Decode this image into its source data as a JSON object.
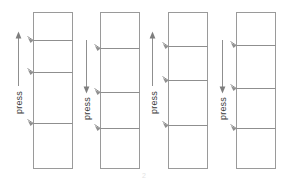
{
  "figure": {
    "background_color": "#ffffff",
    "line_color": "#9a9a9a",
    "label_color": "#3a3a3a",
    "width": 288,
    "height": 180,
    "caption": "2"
  },
  "columns": [
    {
      "id": "column-1",
      "index": 1,
      "x": 33,
      "y": 12,
      "width": 39,
      "height": 156,
      "dividers": [
        40,
        72,
        123
      ],
      "segments": 4,
      "press": {
        "label": "press",
        "direction": "up",
        "arrow_x": 18,
        "arrow_top": 33,
        "arrow_bottom": 86,
        "label_x": 22,
        "label_y": 114
      }
    },
    {
      "id": "column-2",
      "index": 2,
      "x": 100,
      "y": 12,
      "width": 39,
      "height": 156,
      "dividers": [
        48,
        92,
        128
      ],
      "segments": 4,
      "press": {
        "label": "press",
        "direction": "down",
        "arrow_x": 86,
        "arrow_top": 40,
        "arrow_bottom": 92,
        "label_x": 90,
        "label_y": 120
      }
    },
    {
      "id": "column-3",
      "index": 3,
      "x": 168,
      "y": 12,
      "width": 39,
      "height": 156,
      "dividers": [
        46,
        80,
        125
      ],
      "segments": 4,
      "press": {
        "label": "press",
        "direction": "up",
        "arrow_x": 152,
        "arrow_top": 33,
        "arrow_bottom": 86,
        "label_x": 157,
        "label_y": 114
      }
    },
    {
      "id": "column-4",
      "index": 4,
      "x": 236,
      "y": 12,
      "width": 39,
      "height": 156,
      "dividers": [
        45,
        88,
        128
      ],
      "segments": 4,
      "press": {
        "label": "press",
        "direction": "down",
        "arrow_x": 222,
        "arrow_top": 40,
        "arrow_bottom": 92,
        "label_x": 226,
        "label_y": 120
      }
    }
  ]
}
